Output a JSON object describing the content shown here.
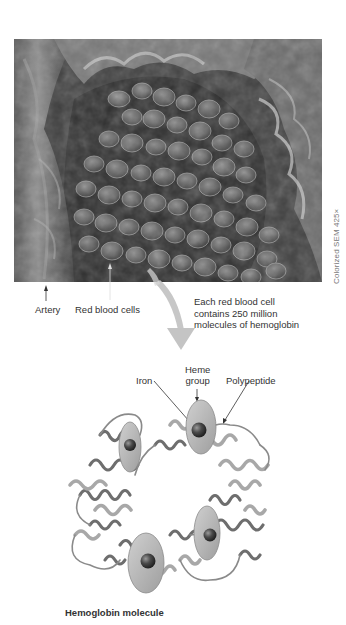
{
  "figure": {
    "photo": {
      "description": "Scanning electron micrograph of an artery cross-section filled with red blood cells",
      "caption": "Colorized SEM 425×",
      "labels": {
        "artery": "Artery",
        "red_blood_cells": "Red blood cells"
      }
    },
    "transition_note": {
      "lines": [
        "Each red blood cell",
        "contains 250 million",
        "molecules of hemoglobin"
      ]
    },
    "molecule": {
      "labels": {
        "heme_line1": "Heme",
        "heme_line2": "group",
        "iron": "Iron",
        "polypeptide": "Polypeptide"
      },
      "title": "Hemoglobin molecule",
      "heme_group_count": 4
    },
    "colors": {
      "arrow": "#c4c4c4",
      "heme_disc": "#b9b9b9",
      "iron": "#4a4a4a",
      "ribbon_dark": "#6e6e6e",
      "ribbon_light": "#a8a8a8",
      "text": "#333333"
    }
  }
}
